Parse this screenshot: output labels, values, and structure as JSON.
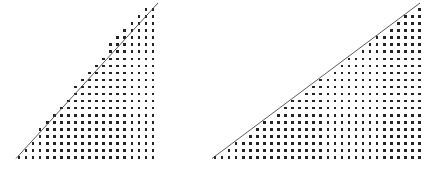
{
  "figure": {
    "title": "Lattice points under a line in a right triangle",
    "background_color": "#ffffff",
    "width": 435,
    "height": 169,
    "panel_count": 2
  },
  "chart_data": {
    "type": "scatter",
    "title": "Lattice points under a line in a right triangle",
    "subtitle": "Two triangular lattice-point diagrams with differing hypotenuse slopes",
    "xlabel": "",
    "ylabel": "",
    "grid": false,
    "legend": null,
    "dot_color": "#232323",
    "line_color": "#4a4a4a",
    "dot_size_px": 2.6,
    "lattice_pitch_px": 7.05,
    "panels": [
      {
        "name": "left-triangle",
        "label": "Left lattice triangle",
        "origin_x_px": 19.0,
        "origin_y_px": 157.5,
        "pitch_px": 7.05,
        "columns": 20,
        "rows": 22,
        "slope": 1.1,
        "line": {
          "x1": 16.0,
          "y1": 158.5,
          "x2": 158.0,
          "y2": 3.0
        },
        "column_heights": [
          1,
          2,
          3,
          5,
          6,
          7,
          8,
          9,
          11,
          12,
          13,
          14,
          15,
          17,
          18,
          19,
          20,
          21,
          22,
          22
        ],
        "total_points": 261
      },
      {
        "name": "right-triangle",
        "label": "Right lattice triangle",
        "origin_x_px": 215.0,
        "origin_y_px": 157.5,
        "pitch_px": 7.05,
        "columns": 30,
        "rows": 22,
        "slope": 0.745,
        "line": {
          "x1": 212.0,
          "y1": 158.5,
          "x2": 420.0,
          "y2": 3.0
        },
        "column_heights": [
          1,
          1,
          2,
          3,
          3,
          4,
          5,
          6,
          6,
          7,
          8,
          9,
          9,
          10,
          11,
          12,
          12,
          13,
          14,
          15,
          15,
          16,
          17,
          18,
          18,
          19,
          20,
          21,
          21,
          22
        ],
        "total_points": 337
      }
    ]
  }
}
